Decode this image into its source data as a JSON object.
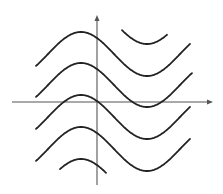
{
  "diagram": {
    "title": "",
    "colors": {
      "background": "#ffffff",
      "curve": "#222222",
      "axis": "#555555"
    },
    "axes": {
      "x_axis": {
        "x1": 12,
        "x2": 213,
        "y": 102,
        "arrow": true,
        "label": ""
      },
      "y_axis": {
        "x": 97,
        "y1": 185,
        "y2": 15,
        "arrow": true,
        "label": ""
      }
    },
    "curve_params": {
      "peak_x": 81,
      "half_period_px": 66,
      "amplitude_px": 22,
      "vertical_spacing_px": 32
    },
    "curves": [
      {
        "name": "curve-top-partial",
        "center_y": 22,
        "x_start": 122,
        "x_end": 167
      },
      {
        "name": "curve-1",
        "center_y": 54,
        "x_start": 36,
        "x_end": 190
      },
      {
        "name": "curve-2",
        "center_y": 85,
        "x_start": 36,
        "x_end": 192
      },
      {
        "name": "curve-3",
        "center_y": 117,
        "x_start": 36,
        "x_end": 190
      },
      {
        "name": "curve-4",
        "center_y": 149,
        "x_start": 36,
        "x_end": 190
      },
      {
        "name": "curve-bottom-partial",
        "center_y": 181,
        "x_start": 60,
        "x_end": 106
      }
    ]
  }
}
